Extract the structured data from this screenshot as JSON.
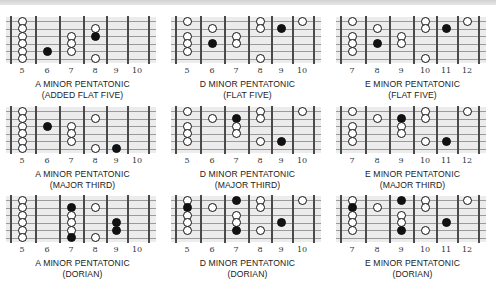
{
  "colors": {
    "board": "#ececec",
    "fret": "#4a4a4a",
    "string": "#9a9a9a",
    "filled_dot": "#111111",
    "open_dot": "#ffffff"
  },
  "diagrams": [
    {
      "title": "A MINOR PENTATONIC",
      "subtitle": "(ADDED FLAT FIVE)",
      "frets": [
        "5",
        "6",
        "7",
        "8",
        "9",
        "10"
      ],
      "dots": [
        {
          "f": 0,
          "s": 0,
          "t": "open"
        },
        {
          "f": 0,
          "s": 1,
          "t": "open"
        },
        {
          "f": 0,
          "s": 2,
          "t": "open"
        },
        {
          "f": 0,
          "s": 3,
          "t": "open"
        },
        {
          "f": 0,
          "s": 4,
          "t": "open"
        },
        {
          "f": 0,
          "s": 5,
          "t": "open"
        },
        {
          "f": 1,
          "s": 4,
          "t": "filled"
        },
        {
          "f": 2,
          "s": 2,
          "t": "open"
        },
        {
          "f": 2,
          "s": 3,
          "t": "open"
        },
        {
          "f": 2,
          "s": 4,
          "t": "open"
        },
        {
          "f": 3,
          "s": 1,
          "t": "open"
        },
        {
          "f": 3,
          "s": 2,
          "t": "filled"
        },
        {
          "f": 3,
          "s": 5,
          "t": "open"
        }
      ]
    },
    {
      "title": "D MINOR PENTATONIC",
      "subtitle": "(FLAT FIVE)",
      "frets": [
        "5",
        "6",
        "7",
        "8",
        "9",
        "10"
      ],
      "dots": [
        {
          "f": 0,
          "s": 0,
          "t": "open"
        },
        {
          "f": 0,
          "s": 2,
          "t": "open"
        },
        {
          "f": 0,
          "s": 3,
          "t": "open"
        },
        {
          "f": 0,
          "s": 4,
          "t": "open"
        },
        {
          "f": 1,
          "s": 1,
          "t": "open"
        },
        {
          "f": 1,
          "s": 3,
          "t": "filled"
        },
        {
          "f": 2,
          "s": 2,
          "t": "open"
        },
        {
          "f": 2,
          "s": 3,
          "t": "open"
        },
        {
          "f": 3,
          "s": 0,
          "t": "open"
        },
        {
          "f": 3,
          "s": 1,
          "t": "open"
        },
        {
          "f": 3,
          "s": 5,
          "t": "open"
        },
        {
          "f": 4,
          "s": 1,
          "t": "filled"
        },
        {
          "f": 5,
          "s": 0,
          "t": "open"
        }
      ]
    },
    {
      "title": "E MINOR PENTATONIC",
      "subtitle": "(FLAT FIVE)",
      "frets": [
        "7",
        "8",
        "9",
        "10",
        "11",
        "12"
      ],
      "dots": [
        {
          "f": 0,
          "s": 0,
          "t": "open"
        },
        {
          "f": 0,
          "s": 2,
          "t": "open"
        },
        {
          "f": 0,
          "s": 3,
          "t": "open"
        },
        {
          "f": 0,
          "s": 4,
          "t": "open"
        },
        {
          "f": 1,
          "s": 1,
          "t": "open"
        },
        {
          "f": 1,
          "s": 3,
          "t": "filled"
        },
        {
          "f": 2,
          "s": 2,
          "t": "open"
        },
        {
          "f": 2,
          "s": 3,
          "t": "open"
        },
        {
          "f": 3,
          "s": 0,
          "t": "open"
        },
        {
          "f": 3,
          "s": 1,
          "t": "open"
        },
        {
          "f": 3,
          "s": 5,
          "t": "open"
        },
        {
          "f": 4,
          "s": 1,
          "t": "filled"
        },
        {
          "f": 5,
          "s": 0,
          "t": "open"
        }
      ]
    },
    {
      "title": "A MINOR PENTATONIC",
      "subtitle": "(MAJOR THIRD)",
      "frets": [
        "5",
        "6",
        "7",
        "8",
        "9",
        "10"
      ],
      "dots": [
        {
          "f": 0,
          "s": 0,
          "t": "open"
        },
        {
          "f": 0,
          "s": 1,
          "t": "open"
        },
        {
          "f": 0,
          "s": 2,
          "t": "open"
        },
        {
          "f": 0,
          "s": 3,
          "t": "open"
        },
        {
          "f": 0,
          "s": 4,
          "t": "open"
        },
        {
          "f": 0,
          "s": 5,
          "t": "open"
        },
        {
          "f": 1,
          "s": 2,
          "t": "filled"
        },
        {
          "f": 2,
          "s": 2,
          "t": "open"
        },
        {
          "f": 2,
          "s": 3,
          "t": "open"
        },
        {
          "f": 2,
          "s": 4,
          "t": "open"
        },
        {
          "f": 3,
          "s": 1,
          "t": "open"
        },
        {
          "f": 3,
          "s": 5,
          "t": "open"
        },
        {
          "f": 4,
          "s": 5,
          "t": "filled"
        }
      ]
    },
    {
      "title": "D MINOR PENTATONIC",
      "subtitle": "(MAJOR THIRD)",
      "frets": [
        "5",
        "6",
        "7",
        "8",
        "9",
        "10"
      ],
      "dots": [
        {
          "f": 0,
          "s": 0,
          "t": "open"
        },
        {
          "f": 0,
          "s": 2,
          "t": "open"
        },
        {
          "f": 0,
          "s": 3,
          "t": "open"
        },
        {
          "f": 0,
          "s": 4,
          "t": "open"
        },
        {
          "f": 1,
          "s": 1,
          "t": "open"
        },
        {
          "f": 2,
          "s": 1,
          "t": "filled"
        },
        {
          "f": 2,
          "s": 2,
          "t": "open"
        },
        {
          "f": 2,
          "s": 3,
          "t": "open"
        },
        {
          "f": 3,
          "s": 0,
          "t": "open"
        },
        {
          "f": 3,
          "s": 1,
          "t": "open"
        },
        {
          "f": 3,
          "s": 4,
          "t": "open"
        },
        {
          "f": 4,
          "s": 4,
          "t": "filled"
        },
        {
          "f": 5,
          "s": 0,
          "t": "open"
        }
      ]
    },
    {
      "title": "E MINOR PENTATONIC",
      "subtitle": "(MAJOR THIRD)",
      "frets": [
        "7",
        "8",
        "9",
        "10",
        "11",
        "12"
      ],
      "dots": [
        {
          "f": 0,
          "s": 0,
          "t": "open"
        },
        {
          "f": 0,
          "s": 2,
          "t": "open"
        },
        {
          "f": 0,
          "s": 3,
          "t": "open"
        },
        {
          "f": 0,
          "s": 4,
          "t": "open"
        },
        {
          "f": 1,
          "s": 1,
          "t": "open"
        },
        {
          "f": 2,
          "s": 1,
          "t": "filled"
        },
        {
          "f": 2,
          "s": 2,
          "t": "open"
        },
        {
          "f": 2,
          "s": 3,
          "t": "open"
        },
        {
          "f": 3,
          "s": 0,
          "t": "open"
        },
        {
          "f": 3,
          "s": 1,
          "t": "open"
        },
        {
          "f": 3,
          "s": 4,
          "t": "open"
        },
        {
          "f": 4,
          "s": 4,
          "t": "filled"
        },
        {
          "f": 5,
          "s": 0,
          "t": "open"
        }
      ]
    },
    {
      "title": "A MINOR PENTATONIC",
      "subtitle": "(DORIAN)",
      "frets": [
        "5",
        "6",
        "7",
        "8",
        "9",
        "10"
      ],
      "dots": [
        {
          "f": 0,
          "s": 0,
          "t": "open"
        },
        {
          "f": 0,
          "s": 1,
          "t": "open"
        },
        {
          "f": 0,
          "s": 2,
          "t": "open"
        },
        {
          "f": 0,
          "s": 3,
          "t": "open"
        },
        {
          "f": 0,
          "s": 4,
          "t": "open"
        },
        {
          "f": 0,
          "s": 5,
          "t": "open"
        },
        {
          "f": 2,
          "s": 1,
          "t": "filled"
        },
        {
          "f": 2,
          "s": 2,
          "t": "open"
        },
        {
          "f": 2,
          "s": 3,
          "t": "open"
        },
        {
          "f": 2,
          "s": 4,
          "t": "open"
        },
        {
          "f": 2,
          "s": 5,
          "t": "filled"
        },
        {
          "f": 3,
          "s": 1,
          "t": "open"
        },
        {
          "f": 3,
          "s": 5,
          "t": "open"
        },
        {
          "f": 4,
          "s": 3,
          "t": "filled"
        },
        {
          "f": 4,
          "s": 4,
          "t": "filled"
        }
      ]
    },
    {
      "title": "D MINOR PENTATONIC",
      "subtitle": "(DORIAN)",
      "frets": [
        "5",
        "6",
        "7",
        "8",
        "9",
        "10"
      ],
      "dots": [
        {
          "f": 0,
          "s": 0,
          "t": "open"
        },
        {
          "f": 0,
          "s": 1,
          "t": "filled"
        },
        {
          "f": 0,
          "s": 2,
          "t": "open"
        },
        {
          "f": 0,
          "s": 3,
          "t": "open"
        },
        {
          "f": 0,
          "s": 4,
          "t": "open"
        },
        {
          "f": 1,
          "s": 1,
          "t": "open"
        },
        {
          "f": 2,
          "s": 0,
          "t": "filled"
        },
        {
          "f": 2,
          "s": 2,
          "t": "open"
        },
        {
          "f": 2,
          "s": 3,
          "t": "open"
        },
        {
          "f": 2,
          "s": 4,
          "t": "filled"
        },
        {
          "f": 3,
          "s": 0,
          "t": "open"
        },
        {
          "f": 3,
          "s": 1,
          "t": "open"
        },
        {
          "f": 3,
          "s": 4,
          "t": "open"
        },
        {
          "f": 4,
          "s": 3,
          "t": "filled"
        },
        {
          "f": 5,
          "s": 0,
          "t": "open"
        }
      ]
    },
    {
      "title": "E MINOR PENTATONIC",
      "subtitle": "(DORIAN)",
      "frets": [
        "7",
        "8",
        "9",
        "10",
        "11",
        "12"
      ],
      "dots": [
        {
          "f": 0,
          "s": 0,
          "t": "open"
        },
        {
          "f": 0,
          "s": 1,
          "t": "filled"
        },
        {
          "f": 0,
          "s": 2,
          "t": "open"
        },
        {
          "f": 0,
          "s": 3,
          "t": "open"
        },
        {
          "f": 0,
          "s": 4,
          "t": "open"
        },
        {
          "f": 1,
          "s": 1,
          "t": "open"
        },
        {
          "f": 2,
          "s": 0,
          "t": "filled"
        },
        {
          "f": 2,
          "s": 2,
          "t": "open"
        },
        {
          "f": 2,
          "s": 3,
          "t": "open"
        },
        {
          "f": 2,
          "s": 4,
          "t": "filled"
        },
        {
          "f": 3,
          "s": 0,
          "t": "open"
        },
        {
          "f": 3,
          "s": 1,
          "t": "open"
        },
        {
          "f": 3,
          "s": 4,
          "t": "open"
        },
        {
          "f": 4,
          "s": 3,
          "t": "filled"
        },
        {
          "f": 5,
          "s": 0,
          "t": "open"
        }
      ]
    }
  ]
}
